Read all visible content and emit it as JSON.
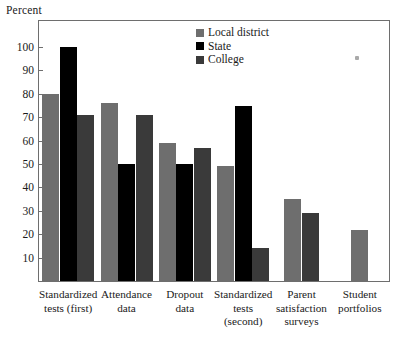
{
  "chart_data": {
    "type": "bar",
    "title": "",
    "ylabel": "Percent",
    "xlabel": "",
    "ylim": [
      0,
      105
    ],
    "yticks": [
      10,
      20,
      30,
      40,
      50,
      60,
      70,
      80,
      90,
      100
    ],
    "grid": false,
    "legend_position": "top-right",
    "categories": [
      "Standardized tests (first)",
      "Attendance data",
      "Dropout data",
      "Standardized tests (second)",
      "Parent satisfaction surveys",
      "Student portfolios"
    ],
    "category_lines": [
      [
        "Standardized",
        "tests (first)"
      ],
      [
        "Attendance",
        "data"
      ],
      [
        "Dropout",
        "data"
      ],
      [
        "Standardized",
        "tests",
        "(second)"
      ],
      [
        "Parent",
        "satisfaction",
        "surveys"
      ],
      [
        "Student",
        "portfolios"
      ]
    ],
    "series": [
      {
        "name": "Local district",
        "color": "#6e6e6e",
        "values": [
          80,
          76,
          59,
          49,
          35,
          22
        ]
      },
      {
        "name": "State",
        "color": "#000000",
        "values": [
          100,
          50,
          50,
          75,
          null,
          null
        ]
      },
      {
        "name": "College",
        "color": "#3a3a3a",
        "values": [
          71,
          71,
          57,
          14,
          29,
          null
        ]
      }
    ]
  },
  "legend": {
    "items": [
      {
        "label": "Local district",
        "color": "#6e6e6e"
      },
      {
        "label": "State",
        "color": "#000000"
      },
      {
        "label": "College",
        "color": "#3a3a3a"
      }
    ]
  },
  "axis": {
    "y_title": "Percent",
    "y_tick_labels": [
      "100",
      "90",
      "80",
      "70",
      "60",
      "50",
      "40",
      "30",
      "20",
      "10"
    ]
  }
}
